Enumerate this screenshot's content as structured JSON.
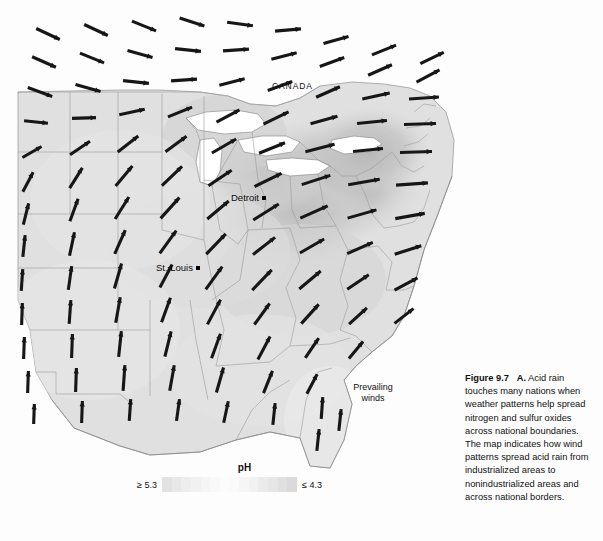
{
  "figure": {
    "number_label": "Figure 9.7",
    "part_label": "A.",
    "caption_text": "Acid rain touches many nations when weather patterns help spread nitrogen and sulfur oxides across national boundaries. The map indicates how wind patterns spread acid rain from industrialized areas to nonindustrialized areas and across national borders."
  },
  "map": {
    "country_labels": [
      {
        "name": "CANADA",
        "text": "CANADA",
        "x": 272,
        "y": 86
      }
    ],
    "cities": [
      {
        "name": "Detroit",
        "text": "Detroit",
        "x": 231,
        "y": 196
      },
      {
        "name": "St. Louis",
        "text": "St. Louis",
        "x": 156,
        "y": 266
      }
    ],
    "annotations": [
      {
        "name": "prevailing-winds",
        "line1": "Prevailing",
        "line2": "winds",
        "x": 340,
        "y": 382
      }
    ]
  },
  "legend": {
    "title": "pH",
    "low_label": "≥ 5.3",
    "high_label": "≤ 4.3",
    "swatches": [
      "#e2e2e2",
      "#e8e8e8",
      "#ededed",
      "#f1f1f1",
      "#f5f5f5",
      "#f9f9f9",
      "#fcfcfc",
      "#fafafa",
      "#f6f6f6",
      "#f2f2f2",
      "#ecebeb",
      "#e6e6e6",
      "#e0e0e0",
      "#dadada"
    ]
  },
  "colors": {
    "background": "#ffffff",
    "land_base": "#dedede",
    "land_light": "#ebebeb",
    "core_dark": "#b9b9b9",
    "core_mid": "#c8c8c8",
    "water": "#ffffff",
    "border_line": "#8c8c8c",
    "arrow": "#161616",
    "text": "#111111"
  },
  "chart_data": {
    "type": "map",
    "variable": "precipitation pH",
    "scale_label": "pH",
    "scale_min_label": "≥ 5.3",
    "scale_max_label": "≤ 4.3",
    "note": "Darker shading indicates lower (more acidic) pH. Arrows show prevailing wind direction and relative strength.",
    "wind_field": [
      {
        "x": 48,
        "y": 34,
        "angle": 25,
        "len": 26
      },
      {
        "x": 96,
        "y": 30,
        "angle": 25,
        "len": 26
      },
      {
        "x": 144,
        "y": 26,
        "angle": 22,
        "len": 26
      },
      {
        "x": 192,
        "y": 22,
        "angle": 18,
        "len": 26
      },
      {
        "x": 240,
        "y": 24,
        "angle": 8,
        "len": 26
      },
      {
        "x": 288,
        "y": 30,
        "angle": -5,
        "len": 26
      },
      {
        "x": 336,
        "y": 40,
        "angle": -16,
        "len": 26
      },
      {
        "x": 384,
        "y": 50,
        "angle": -22,
        "len": 26
      },
      {
        "x": 432,
        "y": 58,
        "angle": -26,
        "len": 26
      },
      {
        "x": 44,
        "y": 62,
        "angle": 24,
        "len": 26
      },
      {
        "x": 92,
        "y": 58,
        "angle": 22,
        "len": 26
      },
      {
        "x": 140,
        "y": 54,
        "angle": 16,
        "len": 26
      },
      {
        "x": 188,
        "y": 50,
        "angle": 6,
        "len": 26
      },
      {
        "x": 236,
        "y": 50,
        "angle": -4,
        "len": 26
      },
      {
        "x": 284,
        "y": 56,
        "angle": -14,
        "len": 26
      },
      {
        "x": 332,
        "y": 62,
        "angle": -20,
        "len": 26
      },
      {
        "x": 380,
        "y": 70,
        "angle": -24,
        "len": 26
      },
      {
        "x": 428,
        "y": 76,
        "angle": -28,
        "len": 26
      },
      {
        "x": 40,
        "y": 92,
        "angle": 20,
        "len": 26
      },
      {
        "x": 88,
        "y": 88,
        "angle": 16,
        "len": 26
      },
      {
        "x": 136,
        "y": 82,
        "angle": 6,
        "len": 26
      },
      {
        "x": 184,
        "y": 80,
        "angle": -4,
        "len": 26
      },
      {
        "x": 232,
        "y": 82,
        "angle": -14,
        "len": 26
      },
      {
        "x": 280,
        "y": 86,
        "angle": -20,
        "len": 26
      },
      {
        "x": 328,
        "y": 92,
        "angle": -24,
        "len": 26
      },
      {
        "x": 376,
        "y": 96,
        "angle": -12,
        "len": 28
      },
      {
        "x": 424,
        "y": 98,
        "angle": -4,
        "len": 30
      },
      {
        "x": 36,
        "y": 122,
        "angle": 6,
        "len": 24
      },
      {
        "x": 84,
        "y": 118,
        "angle": -2,
        "len": 24
      },
      {
        "x": 132,
        "y": 112,
        "angle": -12,
        "len": 26
      },
      {
        "x": 180,
        "y": 112,
        "angle": -22,
        "len": 26
      },
      {
        "x": 228,
        "y": 116,
        "angle": -28,
        "len": 26
      },
      {
        "x": 276,
        "y": 118,
        "angle": -26,
        "len": 28
      },
      {
        "x": 324,
        "y": 120,
        "angle": -16,
        "len": 28
      },
      {
        "x": 372,
        "y": 122,
        "angle": -6,
        "len": 30
      },
      {
        "x": 420,
        "y": 124,
        "angle": -2,
        "len": 32
      },
      {
        "x": 32,
        "y": 152,
        "angle": -30,
        "len": 22
      },
      {
        "x": 80,
        "y": 148,
        "angle": -34,
        "len": 24
      },
      {
        "x": 128,
        "y": 144,
        "angle": -38,
        "len": 26
      },
      {
        "x": 176,
        "y": 144,
        "angle": -36,
        "len": 26
      },
      {
        "x": 224,
        "y": 146,
        "angle": -30,
        "len": 28
      },
      {
        "x": 272,
        "y": 148,
        "angle": -22,
        "len": 28
      },
      {
        "x": 320,
        "y": 148,
        "angle": -14,
        "len": 30
      },
      {
        "x": 368,
        "y": 150,
        "angle": -6,
        "len": 30
      },
      {
        "x": 416,
        "y": 152,
        "angle": -2,
        "len": 32
      },
      {
        "x": 28,
        "y": 182,
        "angle": -62,
        "len": 22
      },
      {
        "x": 76,
        "y": 178,
        "angle": -58,
        "len": 24
      },
      {
        "x": 124,
        "y": 176,
        "angle": -50,
        "len": 26
      },
      {
        "x": 172,
        "y": 176,
        "angle": -44,
        "len": 28
      },
      {
        "x": 220,
        "y": 178,
        "angle": -34,
        "len": 28
      },
      {
        "x": 268,
        "y": 180,
        "angle": -26,
        "len": 30
      },
      {
        "x": 316,
        "y": 180,
        "angle": -18,
        "len": 30
      },
      {
        "x": 364,
        "y": 182,
        "angle": -10,
        "len": 32
      },
      {
        "x": 412,
        "y": 184,
        "angle": -4,
        "len": 32
      },
      {
        "x": 26,
        "y": 214,
        "angle": -76,
        "len": 22
      },
      {
        "x": 74,
        "y": 210,
        "angle": -70,
        "len": 24
      },
      {
        "x": 122,
        "y": 208,
        "angle": -58,
        "len": 26
      },
      {
        "x": 170,
        "y": 208,
        "angle": -48,
        "len": 28
      },
      {
        "x": 218,
        "y": 210,
        "angle": -40,
        "len": 28
      },
      {
        "x": 266,
        "y": 212,
        "angle": -32,
        "len": 30
      },
      {
        "x": 314,
        "y": 212,
        "angle": -24,
        "len": 30
      },
      {
        "x": 362,
        "y": 214,
        "angle": -16,
        "len": 30
      },
      {
        "x": 410,
        "y": 216,
        "angle": -10,
        "len": 30
      },
      {
        "x": 24,
        "y": 246,
        "angle": -84,
        "len": 22
      },
      {
        "x": 72,
        "y": 244,
        "angle": -78,
        "len": 24
      },
      {
        "x": 120,
        "y": 242,
        "angle": -66,
        "len": 26
      },
      {
        "x": 168,
        "y": 242,
        "angle": -54,
        "len": 28
      },
      {
        "x": 216,
        "y": 244,
        "angle": -46,
        "len": 28
      },
      {
        "x": 264,
        "y": 246,
        "angle": -38,
        "len": 28
      },
      {
        "x": 312,
        "y": 246,
        "angle": -30,
        "len": 28
      },
      {
        "x": 360,
        "y": 248,
        "angle": -24,
        "len": 28
      },
      {
        "x": 408,
        "y": 250,
        "angle": -18,
        "len": 28
      },
      {
        "x": 22,
        "y": 280,
        "angle": -86,
        "len": 22
      },
      {
        "x": 70,
        "y": 278,
        "angle": -82,
        "len": 24
      },
      {
        "x": 118,
        "y": 276,
        "angle": -74,
        "len": 26
      },
      {
        "x": 166,
        "y": 276,
        "angle": -62,
        "len": 26
      },
      {
        "x": 214,
        "y": 278,
        "angle": -54,
        "len": 28
      },
      {
        "x": 262,
        "y": 280,
        "angle": -46,
        "len": 28
      },
      {
        "x": 310,
        "y": 280,
        "angle": -40,
        "len": 28
      },
      {
        "x": 358,
        "y": 282,
        "angle": -34,
        "len": 26
      },
      {
        "x": 406,
        "y": 284,
        "angle": -28,
        "len": 26
      },
      {
        "x": 22,
        "y": 314,
        "angle": -88,
        "len": 22
      },
      {
        "x": 70,
        "y": 312,
        "angle": -86,
        "len": 24
      },
      {
        "x": 118,
        "y": 310,
        "angle": -80,
        "len": 26
      },
      {
        "x": 166,
        "y": 310,
        "angle": -70,
        "len": 26
      },
      {
        "x": 214,
        "y": 312,
        "angle": -62,
        "len": 28
      },
      {
        "x": 262,
        "y": 314,
        "angle": -54,
        "len": 26
      },
      {
        "x": 310,
        "y": 314,
        "angle": -48,
        "len": 26
      },
      {
        "x": 358,
        "y": 316,
        "angle": -42,
        "len": 24
      },
      {
        "x": 404,
        "y": 316,
        "angle": -38,
        "len": 24
      },
      {
        "x": 24,
        "y": 348,
        "angle": -88,
        "len": 22
      },
      {
        "x": 72,
        "y": 346,
        "angle": -88,
        "len": 24
      },
      {
        "x": 120,
        "y": 344,
        "angle": -84,
        "len": 26
      },
      {
        "x": 168,
        "y": 344,
        "angle": -76,
        "len": 26
      },
      {
        "x": 216,
        "y": 346,
        "angle": -70,
        "len": 26
      },
      {
        "x": 264,
        "y": 348,
        "angle": -62,
        "len": 26
      },
      {
        "x": 312,
        "y": 348,
        "angle": -56,
        "len": 24
      },
      {
        "x": 356,
        "y": 350,
        "angle": -50,
        "len": 22
      },
      {
        "x": 28,
        "y": 382,
        "angle": -88,
        "len": 22
      },
      {
        "x": 76,
        "y": 380,
        "angle": -88,
        "len": 24
      },
      {
        "x": 124,
        "y": 378,
        "angle": -86,
        "len": 26
      },
      {
        "x": 172,
        "y": 378,
        "angle": -80,
        "len": 26
      },
      {
        "x": 220,
        "y": 380,
        "angle": -74,
        "len": 26
      },
      {
        "x": 268,
        "y": 382,
        "angle": -68,
        "len": 24
      },
      {
        "x": 312,
        "y": 384,
        "angle": -62,
        "len": 22
      },
      {
        "x": 34,
        "y": 414,
        "angle": -88,
        "len": 20
      },
      {
        "x": 82,
        "y": 412,
        "angle": -88,
        "len": 22
      },
      {
        "x": 130,
        "y": 410,
        "angle": -86,
        "len": 22
      },
      {
        "x": 178,
        "y": 410,
        "angle": -82,
        "len": 22
      },
      {
        "x": 226,
        "y": 412,
        "angle": -78,
        "len": 22
      },
      {
        "x": 274,
        "y": 414,
        "angle": -84,
        "len": 22
      },
      {
        "x": 322,
        "y": 408,
        "angle": -86,
        "len": 22
      },
      {
        "x": 318,
        "y": 440,
        "angle": -84,
        "len": 22
      },
      {
        "x": 340,
        "y": 420,
        "angle": -84,
        "len": 22
      }
    ]
  }
}
